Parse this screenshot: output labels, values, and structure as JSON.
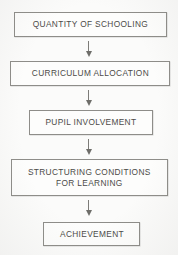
{
  "diagram": {
    "orientation": "vertical",
    "background_color": "#fbfbfa",
    "box_border_color": "#8e8d89",
    "text_color": "#4c4b48",
    "arrow_color": "#7d7c78",
    "nodes": [
      {
        "id": "quantity-of-schooling",
        "label": "QUANTITY OF SCHOOLING"
      },
      {
        "id": "curriculum-allocation",
        "label": "CURRICULUM ALLOCATION"
      },
      {
        "id": "pupil-involvement",
        "label": "PUPIL INVOLVEMENT"
      },
      {
        "id": "structuring-conditions",
        "label": "STRUCTURING CONDITIONS\nFOR LEARNING"
      },
      {
        "id": "achievement",
        "label": "ACHIEVEMENT"
      }
    ],
    "edges": [
      {
        "id": "edge-1",
        "from": "quantity-of-schooling",
        "to": "curriculum-allocation",
        "marker": "down-arrow-icon"
      },
      {
        "id": "edge-2",
        "from": "curriculum-allocation",
        "to": "pupil-involvement",
        "marker": "down-arrow-icon"
      },
      {
        "id": "edge-3",
        "from": "pupil-involvement",
        "to": "structuring-conditions",
        "marker": "down-arrow-icon"
      },
      {
        "id": "edge-4",
        "from": "structuring-conditions",
        "to": "achievement",
        "marker": "down-arrow-icon"
      }
    ]
  }
}
